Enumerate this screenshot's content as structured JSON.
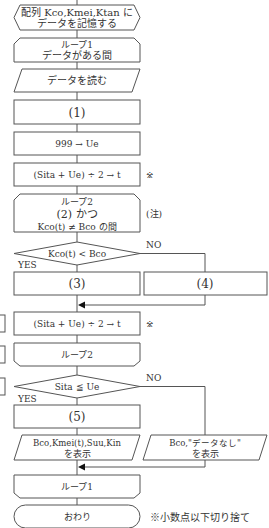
{
  "flowchart": {
    "prep": {
      "line1": "配列 Kco,Kmei,Ktan に",
      "line2": "データを記憶する"
    },
    "loop1_start": {
      "line1": "ループ1",
      "line2": "データがある間"
    },
    "read": {
      "label": "データを読む"
    },
    "step1": {
      "label": "(1)"
    },
    "init_ue": {
      "label": "999 → Ue"
    },
    "calc_t1": {
      "label": "(Sita + Ue) ÷ 2 → t",
      "mark": "※"
    },
    "loop2_start": {
      "line1": "ループ2",
      "line2": "(2) かつ",
      "line3": "Kco(t) ≠ Bco の間",
      "note": "(注)"
    },
    "decision1": {
      "label": "Kco(t) < Bco",
      "yes": "YES",
      "no": "NO"
    },
    "step3": {
      "label": "(3)"
    },
    "step4": {
      "label": "(4)"
    },
    "calc_t2": {
      "label": "(Sita + Ue) ÷ 2 → t",
      "mark": "※"
    },
    "loop2_end": {
      "label": "ループ2"
    },
    "decision2": {
      "label": "Sita ≦ Ue",
      "yes": "YES",
      "no": "NO"
    },
    "step5": {
      "label": "(5)"
    },
    "output_found": {
      "line1": "Bco,Kmei(t),Suu,Kin",
      "line2": "を表示"
    },
    "output_none": {
      "line1": "Bco,\"データなし\"",
      "line2": "を表示"
    },
    "loop1_end": {
      "label": "ループ1"
    },
    "terminal": {
      "label": "おわり"
    },
    "footnote": "※小数点以下切り捨て"
  }
}
